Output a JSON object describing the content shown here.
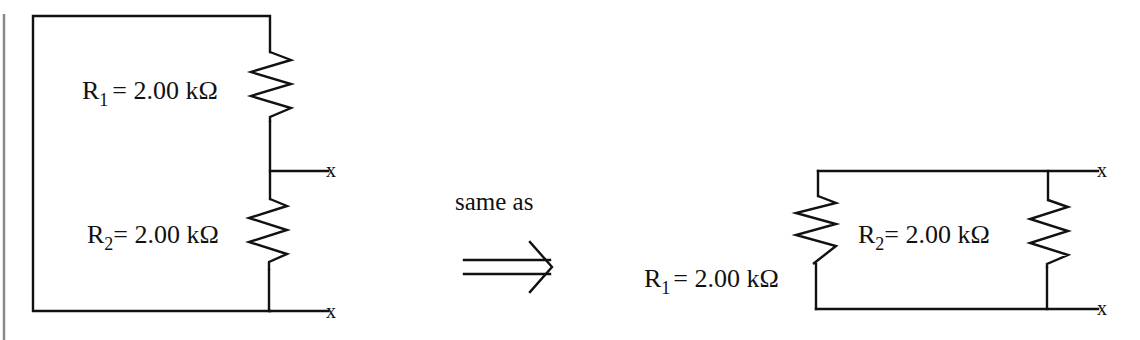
{
  "diagram": {
    "left_circuit": {
      "r1_label": {
        "name": "R",
        "subscript": "1",
        "value": "= 2.00 kΩ"
      },
      "r2_label": {
        "name": "R",
        "subscript": "2",
        "value": "= 2.00 kΩ"
      },
      "terminal_top": "x",
      "terminal_bottom": "x"
    },
    "connector": {
      "caption": "same as",
      "arrow_icon": "double-right-arrow"
    },
    "right_circuit": {
      "r1_label": {
        "name": "R",
        "subscript": "1",
        "value": "= 2.00 kΩ"
      },
      "r2_label": {
        "name": "R",
        "subscript": "2",
        "value": "= 2.00 kΩ"
      },
      "terminal_top": "x",
      "terminal_bottom": "x"
    },
    "colors": {
      "line": "#111111",
      "margin_rule": "#8a8a8a",
      "background": "#ffffff"
    }
  }
}
